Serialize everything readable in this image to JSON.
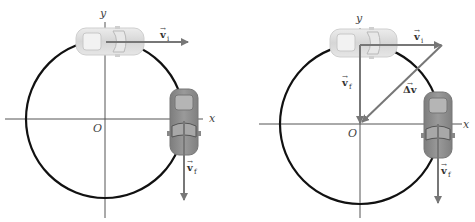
{
  "figure": {
    "panels": [
      {
        "id": "left",
        "axis_labels": {
          "x": "x",
          "y": "y",
          "origin": "O"
        },
        "vectors": [
          {
            "symbol": "v",
            "subscript": "i",
            "direction": "right"
          },
          {
            "symbol": "v",
            "subscript": "f",
            "direction": "down"
          }
        ],
        "cars": [
          "car-top-light",
          "car-right-dark"
        ]
      },
      {
        "id": "right",
        "axis_labels": {
          "x": "x",
          "y": "y",
          "origin": "O"
        },
        "vectors": [
          {
            "symbol": "v",
            "subscript": "i",
            "direction": "right"
          },
          {
            "symbol": "v",
            "subscript": "f",
            "direction": "down",
            "placement": "tail-to-tail at origin"
          },
          {
            "symbol": "Δv",
            "subscript": "",
            "direction": "from tip of v_i to tip of v_f"
          },
          {
            "symbol": "v",
            "subscript": "f",
            "direction": "down",
            "placement": "at car"
          }
        ],
        "cars": [
          "car-top-light",
          "car-right-dark"
        ]
      }
    ],
    "colors": {
      "circle": "#111111",
      "axis": "#555555",
      "vector": "#777777",
      "car_light": "#d9d9d9",
      "car_dark": "#8f8f8f"
    }
  },
  "labels": {
    "x": "x",
    "y": "y",
    "O": "O",
    "v": "v",
    "i": "i",
    "f": "f",
    "dv": "Δv",
    "arrow_over": "→"
  }
}
